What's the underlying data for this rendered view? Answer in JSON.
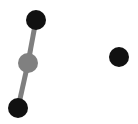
{
  "canvas": {
    "width": 138,
    "height": 124,
    "background": "#ffffff"
  },
  "colors": {
    "node": "#111111",
    "hub": "#808080",
    "edge": "#7f7f7f"
  },
  "nodes": [
    {
      "id": "top",
      "x": 36,
      "y": 20,
      "r": 10,
      "color": "#111111"
    },
    {
      "id": "middle",
      "x": 28,
      "y": 63,
      "r": 10,
      "color": "#808080"
    },
    {
      "id": "bottom",
      "x": 18,
      "y": 108,
      "r": 10,
      "color": "#111111"
    },
    {
      "id": "right",
      "x": 119,
      "y": 57,
      "r": 10,
      "color": "#111111"
    }
  ],
  "edges": [
    {
      "from": "top",
      "to": "middle"
    },
    {
      "from": "middle",
      "to": "bottom"
    }
  ]
}
